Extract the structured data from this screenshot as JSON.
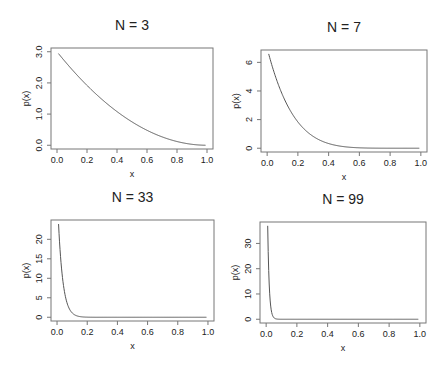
{
  "figure": {
    "layout": "2x2 grid",
    "line_color": "#555555",
    "box_color": "#777777"
  },
  "chart_data": [
    {
      "type": "line",
      "title": "N = 3",
      "N": 3,
      "formula": "p(x) = N(1-x)^(N-1)",
      "xlabel": "x",
      "ylabel": "p(x)",
      "xlim": [
        0,
        1
      ],
      "ylim": [
        0,
        3.0
      ],
      "xticks": [
        "0.0",
        "0.2",
        "0.4",
        "0.6",
        "0.8",
        "1.0"
      ],
      "yticks": [
        "0.0",
        "1.0",
        "2.0",
        "3.0"
      ],
      "ytick_values": [
        0,
        1,
        2,
        3
      ],
      "x": [
        0.01,
        0.2,
        0.4,
        0.6,
        0.8,
        0.99
      ],
      "values": [
        2.94,
        1.92,
        1.08,
        0.48,
        0.12,
        0.0003
      ],
      "grid": false,
      "box": [
        51,
        48,
        213,
        149
      ]
    },
    {
      "type": "line",
      "title": "N = 7",
      "N": 7,
      "formula": "p(x) = N(1-x)^(N-1)",
      "xlabel": "x",
      "ylabel": "p(x)",
      "xlim": [
        0,
        1
      ],
      "ylim": [
        0,
        6.6
      ],
      "xticks": [
        "0.0",
        "0.2",
        "0.4",
        "0.6",
        "0.8",
        "1.0"
      ],
      "yticks": [
        "0",
        "2",
        "4",
        "6"
      ],
      "ytick_values": [
        0,
        2,
        4,
        6
      ],
      "x": [
        0.01,
        0.1,
        0.2,
        0.3,
        0.4,
        0.6,
        0.8,
        0.99
      ],
      "values": [
        6.59,
        3.72,
        1.84,
        0.82,
        0.33,
        0.03,
        0.0,
        0.0
      ],
      "grid": false,
      "box": [
        261,
        50,
        427,
        152
      ]
    },
    {
      "type": "line",
      "title": "N = 33",
      "N": 33,
      "formula": "p(x) = N(1-x)^(N-1)",
      "xlabel": "x",
      "ylabel": "p(x)",
      "xlim": [
        0,
        1
      ],
      "ylim": [
        0,
        24
      ],
      "xticks": [
        "0.0",
        "0.2",
        "0.4",
        "0.6",
        "0.8",
        "1.0"
      ],
      "yticks": [
        "0",
        "5",
        "10",
        "15",
        "20"
      ],
      "ytick_values": [
        0,
        5,
        10,
        15,
        20
      ],
      "x": [
        0.01,
        0.05,
        0.1,
        0.15,
        0.2,
        0.4,
        1.0
      ],
      "values": [
        23.9,
        6.4,
        1.1,
        0.18,
        0.03,
        0.0,
        0.0
      ],
      "grid": false,
      "box": [
        51,
        220,
        214,
        321
      ]
    },
    {
      "type": "line",
      "title": "N = 99",
      "N": 99,
      "formula": "p(x) = N(1-x)^(N-1)",
      "xlabel": "x",
      "ylabel": "p(x)",
      "xlim": [
        0,
        1
      ],
      "ylim": [
        0,
        37
      ],
      "xticks": [
        "0.0",
        "0.2",
        "0.4",
        "0.6",
        "0.8",
        "1.0"
      ],
      "yticks": [
        "0",
        "10",
        "20",
        "30"
      ],
      "ytick_values": [
        0,
        10,
        20,
        30
      ],
      "x": [
        0.01,
        0.02,
        0.05,
        0.1,
        0.2,
        1.0
      ],
      "values": [
        36.9,
        13.6,
        0.65,
        0.003,
        0.0,
        0.0
      ],
      "grid": false,
      "box": [
        260,
        222,
        426,
        323
      ]
    }
  ]
}
